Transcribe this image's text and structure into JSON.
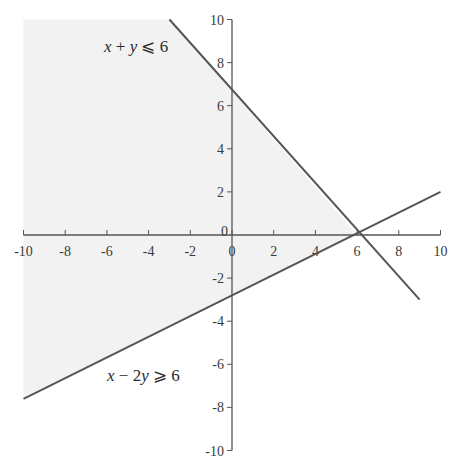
{
  "chart_data": {
    "type": "line",
    "title": "",
    "xlabel": "",
    "ylabel": "",
    "xlim": [
      -10,
      10
    ],
    "ylim": [
      -10,
      10
    ],
    "grid": false,
    "x_ticks": [
      -10,
      -8,
      -6,
      -4,
      -2,
      0,
      2,
      4,
      6,
      8,
      10
    ],
    "y_ticks": [
      -10,
      -8,
      -6,
      -4,
      -2,
      0,
      2,
      4,
      6,
      8,
      10
    ],
    "x_tick_labels": [
      "-10",
      "-8",
      "-6",
      "-4",
      "-2",
      "0",
      "2",
      "4",
      "6",
      "8",
      "10"
    ],
    "y_tick_labels": [
      "-10",
      "-8",
      "-6",
      "-4",
      "-2",
      "0",
      "2",
      "4",
      "6",
      "8",
      "10"
    ],
    "series": [
      {
        "name": "x + y ≤ 6",
        "equation": "x + y = 6",
        "points": [
          [
            -3,
            10
          ],
          [
            9,
            -3
          ]
        ]
      },
      {
        "name": "x − 2y ≥ 6",
        "equation": "x − 2y = 6",
        "points": [
          [
            -10,
            -7.6
          ],
          [
            10,
            2
          ]
        ]
      }
    ],
    "shaded_region": {
      "description": "Light grey region left of both lines, bounded by x + y = 6 above-right and x − 2y = 6 below, meeting at (6, 0)",
      "vertices": [
        [
          -10,
          10
        ],
        [
          -3,
          10
        ],
        [
          6,
          0
        ],
        [
          -10,
          -7.6
        ]
      ],
      "color": "#f2f2f2"
    },
    "annotations": [
      {
        "text": "x + y ⩽ 6",
        "x": -5.5,
        "y": 8.5
      },
      {
        "text": "x − 2y ⩾ 6",
        "x": -5.5,
        "y": -6.5
      }
    ],
    "intersection": [
      6,
      0
    ]
  },
  "labels": {
    "ineq1": {
      "x": "x",
      "op1": " + ",
      "y": "y",
      "rel": " ⩽ 6"
    },
    "ineq2": {
      "x": "x",
      "op1": " − 2",
      "y": "y",
      "rel": " ⩾ 6"
    }
  },
  "colors": {
    "axis": "#555555",
    "line": "#555555",
    "shade": "#f2f2f2"
  }
}
